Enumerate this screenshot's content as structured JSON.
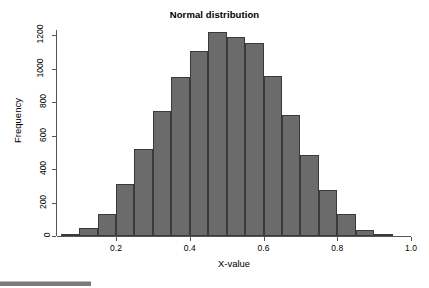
{
  "chart_data": {
    "type": "bar",
    "title": "Normal distribution",
    "xlabel": "X-value",
    "ylabel": "Frequency",
    "grid": false,
    "legend": null,
    "xlim": [
      0.04,
      1.0
    ],
    "ylim": [
      0,
      1230
    ],
    "bin_width": 0.05,
    "x_ticks": [
      "0.2",
      "0.4",
      "0.6",
      "0.8",
      "1.0"
    ],
    "x_tick_values": [
      0.2,
      0.4,
      0.6,
      0.8,
      1.0
    ],
    "y_ticks": [
      "0",
      "200",
      "400",
      "600",
      "800",
      "1000",
      "1200"
    ],
    "y_tick_values": [
      0,
      200,
      400,
      600,
      800,
      1000,
      1200
    ],
    "bin_edges": [
      0.05,
      0.1,
      0.15,
      0.2,
      0.25,
      0.3,
      0.35,
      0.4,
      0.45,
      0.5,
      0.55,
      0.6,
      0.65,
      0.7,
      0.75,
      0.8,
      0.85,
      0.9,
      0.95,
      1.0
    ],
    "categories": [
      "0.05-0.10",
      "0.10-0.15",
      "0.15-0.20",
      "0.20-0.25",
      "0.25-0.30",
      "0.30-0.35",
      "0.35-0.40",
      "0.40-0.45",
      "0.45-0.50",
      "0.50-0.55",
      "0.55-0.60",
      "0.60-0.65",
      "0.65-0.70",
      "0.70-0.75",
      "0.75-0.80",
      "0.80-0.85",
      "0.85-0.90",
      "0.90-0.95",
      "0.95-1.00"
    ],
    "values": [
      12,
      45,
      132,
      308,
      520,
      745,
      950,
      1105,
      1220,
      1190,
      1150,
      955,
      725,
      485,
      275,
      130,
      35,
      5,
      0
    ]
  },
  "bottom_strip": {
    "label": "bottom-edge-artifact"
  }
}
